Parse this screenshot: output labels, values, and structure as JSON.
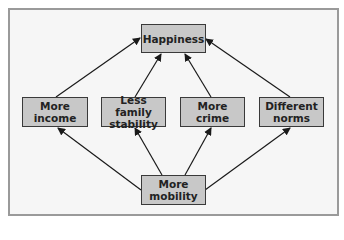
{
  "diagram": {
    "type": "causal-flow",
    "nodes": {
      "happiness": {
        "line1": "Happiness",
        "line2": ""
      },
      "income": {
        "line1": "More",
        "line2": "income"
      },
      "family": {
        "line1": "Less family",
        "line2": "stability"
      },
      "crime": {
        "line1": "More",
        "line2": "crime"
      },
      "norms": {
        "line1": "Different",
        "line2": "norms"
      },
      "mobility": {
        "line1": "More",
        "line2": "mobility"
      }
    },
    "edges": [
      {
        "from": "mobility",
        "to": "income"
      },
      {
        "from": "mobility",
        "to": "family"
      },
      {
        "from": "mobility",
        "to": "crime"
      },
      {
        "from": "mobility",
        "to": "norms"
      },
      {
        "from": "income",
        "to": "happiness"
      },
      {
        "from": "family",
        "to": "happiness"
      },
      {
        "from": "crime",
        "to": "happiness"
      },
      {
        "from": "norms",
        "to": "happiness"
      }
    ],
    "colors": {
      "node_fill": "#c8c8c8",
      "node_border": "#3a3a3a",
      "frame_border": "#9a9a9a",
      "frame_fill": "#f6f6f6",
      "arrow": "#1a1a1a"
    }
  }
}
